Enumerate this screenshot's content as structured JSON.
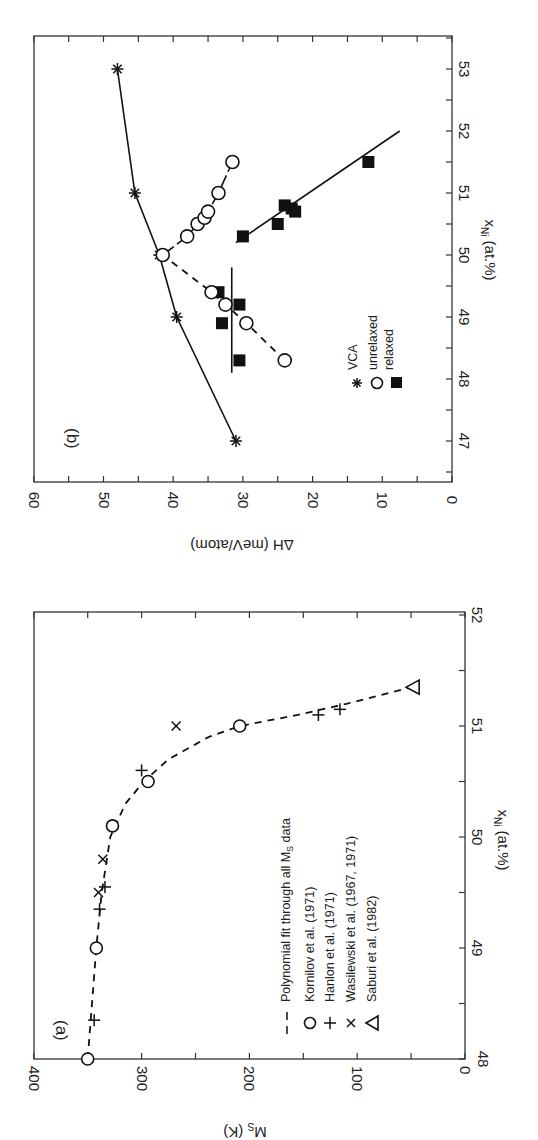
{
  "chart_data": [
    {
      "panel": "(a)",
      "type": "scatter",
      "title": "",
      "xlabel": "x_Ni (at.%)",
      "ylabel": "M_s (K)",
      "xlim": [
        48,
        52
      ],
      "ylim": [
        0,
        400
      ],
      "xticks": [
        "48",
        "49",
        "50",
        "51",
        "52"
      ],
      "yticks": [
        "0",
        "100",
        "200",
        "300",
        "400"
      ],
      "orientation": "rotated 90° (x axis runs vertically along right edge)",
      "legend": [
        {
          "marker": "dash",
          "label": "Polynomial fit through all M_s data"
        },
        {
          "marker": "circle",
          "label": "Kornilov et al. (1971)"
        },
        {
          "marker": "plus",
          "label": "Hanlon et al. (1971)"
        },
        {
          "marker": "cross",
          "label": "Wasilewski et al. (1967, 1971)"
        },
        {
          "marker": "triangle",
          "label": "Saburi et al. (1982)"
        }
      ],
      "series": [
        {
          "name": "Kornilov et al. (1971)",
          "marker": "circle",
          "points": [
            [
              48.0,
              350
            ],
            [
              49.0,
              342
            ],
            [
              50.1,
              327
            ],
            [
              50.5,
              294
            ],
            [
              51.0,
              209
            ]
          ]
        },
        {
          "name": "Hanlon et al. (1971)",
          "marker": "plus",
          "points": [
            [
              48.35,
              344
            ],
            [
              49.35,
              339
            ],
            [
              49.55,
              334
            ],
            [
              50.6,
              300
            ],
            [
              51.1,
              136
            ],
            [
              51.15,
              116
            ]
          ]
        },
        {
          "name": "Wasilewski et al. (1967, 1971)",
          "marker": "cross",
          "points": [
            [
              49.5,
              340
            ],
            [
              49.8,
              336
            ],
            [
              51.0,
              268
            ]
          ]
        },
        {
          "name": "Saburi et al. (1982)",
          "marker": "triangle",
          "points": [
            [
              51.35,
              49
            ]
          ]
        },
        {
          "name": "Polynomial fit through all M_s data",
          "marker": "dash",
          "points": [
            [
              48.0,
              350
            ],
            [
              48.5,
              346
            ],
            [
              49.0,
              342
            ],
            [
              49.5,
              337
            ],
            [
              50.0,
              329
            ],
            [
              50.3,
              315
            ],
            [
              50.5,
              298
            ],
            [
              50.7,
              275
            ],
            [
              50.9,
              238
            ],
            [
              51.0,
              209
            ],
            [
              51.1,
              155
            ],
            [
              51.2,
              110
            ],
            [
              51.35,
              49
            ]
          ]
        }
      ]
    },
    {
      "panel": "(b)",
      "type": "line",
      "title": "",
      "xlabel": "x_Ni (at.%)",
      "ylabel": "ΔH (meV/atom)",
      "xlim": [
        46.6,
        53.6
      ],
      "ylim": [
        0,
        60
      ],
      "xticks": [
        "47",
        "48",
        "49",
        "50",
        "51",
        "52",
        "53"
      ],
      "yticks": [
        "0",
        "10",
        "20",
        "30",
        "40",
        "50",
        "60"
      ],
      "orientation": "rotated 90° (x axis runs vertically along right edge)",
      "legend": [
        {
          "marker": "star",
          "label": "VCA"
        },
        {
          "marker": "open-circle",
          "label": "unrelaxed"
        },
        {
          "marker": "filled-square",
          "label": "relaxed"
        }
      ],
      "series": [
        {
          "name": "VCA",
          "marker": "star",
          "line": "solid",
          "points": [
            [
              47,
              31
            ],
            [
              49,
              39.5
            ],
            [
              50,
              42
            ],
            [
              51,
              45.5
            ],
            [
              53,
              48
            ]
          ]
        },
        {
          "name": "unrelaxed",
          "marker": "open-circle",
          "line": "dashed",
          "points": [
            [
              48.3,
              24
            ],
            [
              48.9,
              29.5
            ],
            [
              49.2,
              32.5
            ],
            [
              49.4,
              34.5
            ],
            [
              50.0,
              41.5
            ],
            [
              50.3,
              38
            ],
            [
              50.5,
              36.5
            ],
            [
              50.6,
              35.5
            ],
            [
              50.7,
              35
            ],
            [
              51.0,
              33.5
            ],
            [
              51.5,
              31.5
            ]
          ]
        },
        {
          "name": "relaxed",
          "marker": "filled-square",
          "line": "solid",
          "points": [
            [
              48.3,
              30.5
            ],
            [
              48.9,
              33
            ],
            [
              49.2,
              30.5
            ],
            [
              49.4,
              33.5
            ],
            [
              50.3,
              30
            ],
            [
              50.5,
              25
            ],
            [
              50.7,
              22.5
            ],
            [
              50.75,
              23
            ],
            [
              50.8,
              24
            ],
            [
              51.5,
              12
            ]
          ]
        }
      ],
      "annotations": [
        "vertical reference line at ΔH ≈ 31.5 spanning x_Ni ≈ 48.1–49.8"
      ]
    }
  ],
  "labels": {
    "panel_a": "(a)",
    "panel_b": "(b)",
    "a_xlabel_main": "x",
    "a_xlabel_sub": "Ni",
    "a_xlabel_unit": " (at.%)",
    "a_ylabel_main": "M",
    "a_ylabel_sub": "S",
    "a_ylabel_unit": " (K)",
    "b_xlabel_main": "x",
    "b_xlabel_sub": "Ni",
    "b_xlabel_unit": " (at.%)",
    "b_ylabel": "ΔH (meV/atom)",
    "a_legend": [
      "Polynomial fit through all M",
      "Kornilov et al. (1971)",
      "Hanlon et al. (1971)",
      "Wasilewski et al. (1967, 1971)",
      "Saburi et al. (1982)"
    ],
    "a_legend_sub": "S",
    "a_legend_tail": " data",
    "b_legend": [
      "VCA",
      "unrelaxed",
      "relaxed"
    ]
  }
}
